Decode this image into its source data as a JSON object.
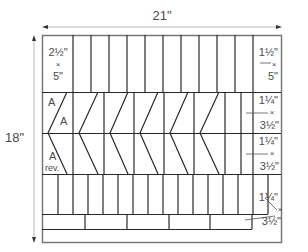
{
  "diagram": {
    "width_label": "21\"",
    "height_label": "18\"",
    "colors": {
      "line": "#2a2a2a",
      "outer": "#777777",
      "arrow": "#cccccc",
      "text": "#4a4a4a"
    },
    "top_row": {
      "left_label": {
        "w": "2½\"",
        "x": "×",
        "h": "5\""
      },
      "right_label": {
        "w": "1½\"",
        "x": "×",
        "h": "5\""
      }
    },
    "chevron_rows": {
      "a_label": "A",
      "a2_label": "A",
      "a_rev_label": "A",
      "rev_label": "rev.",
      "upper_right_label": {
        "w": "1¼\"",
        "x": "×",
        "h": "3½\""
      },
      "lower_right_label": {
        "w": "1¼\"",
        "x": "×",
        "h": "3½\""
      }
    },
    "bottom_strips": {
      "label": {
        "w": "1¼\"",
        "x": "×",
        "h": "3½\""
      }
    }
  }
}
